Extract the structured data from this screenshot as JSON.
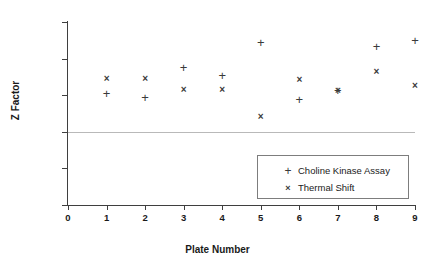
{
  "chart_data": {
    "type": "scatter",
    "title": "",
    "xlabel": "Plate Number",
    "ylabel": "Z Factor",
    "xlim": [
      0,
      9
    ],
    "ylim": [
      0,
      1
    ],
    "grid": false,
    "legend_position": "inside-bottom-right",
    "x_ticks": [
      "0",
      "1",
      "2",
      "3",
      "4",
      "5",
      "6",
      "7",
      "8",
      "9"
    ],
    "y_ticks": [
      "0",
      "0.2",
      "0.4",
      "0.6",
      "0.8",
      "1"
    ],
    "x": [
      1,
      2,
      3,
      4,
      5,
      6,
      7,
      8,
      9
    ],
    "series": [
      {
        "name": "Choline Kinase Assay",
        "marker": "plus",
        "values": [
          0.61,
          0.585,
          0.75,
          0.71,
          0.89,
          0.575,
          0.625,
          0.865,
          0.9
        ]
      },
      {
        "name": "Thermal Shift",
        "marker": "cross",
        "values": [
          0.69,
          0.69,
          0.63,
          0.63,
          0.485,
          0.685,
          0.625,
          0.73,
          0.655
        ]
      }
    ],
    "threshold": {
      "label": "",
      "value": 0.4,
      "color": "#b9b9b9"
    },
    "colors": {
      "marker": "#3a3a3a",
      "axis": "#3f3f3f",
      "threshold": "#b9b9b9",
      "text": "#1a1a1a",
      "legend_border": "#7d7d7d",
      "background": "#ffffff"
    }
  },
  "legend": {
    "items": [
      {
        "marker_glyph": "+",
        "label": "Choline Kinase Assay",
        "icon_name": "plus-marker-icon"
      },
      {
        "marker_glyph": "×",
        "label": "Thermal Shift",
        "icon_name": "cross-marker-icon"
      }
    ]
  },
  "axes": {
    "y_title": "Z Factor",
    "x_title": "Plate Number"
  }
}
